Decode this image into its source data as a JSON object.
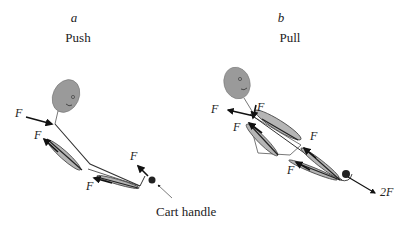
{
  "panels": [
    {
      "letter": "a",
      "title": "Push",
      "force_labels": [
        "F",
        "F",
        "F",
        "F"
      ],
      "annotation": "Cart handle"
    },
    {
      "letter": "b",
      "title": "Pull",
      "force_labels": [
        "F",
        "F",
        "F",
        "F",
        "F"
      ],
      "resultant_label": "2F"
    }
  ],
  "colors": {
    "head_fill": "#9a9a9a",
    "muscle_fill": "#b5b5b5",
    "line": "#333333",
    "arrow": "#111111"
  }
}
